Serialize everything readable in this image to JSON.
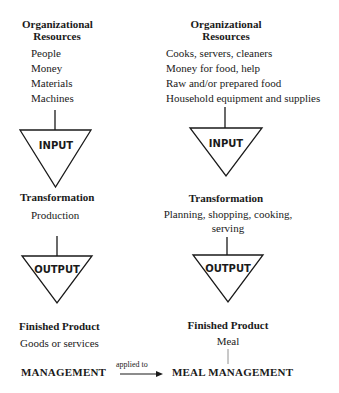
{
  "left_column": {
    "resources_heading": [
      "Organizational",
      "Resources"
    ],
    "resources": [
      "People",
      "Money",
      "Materials",
      "Machines"
    ],
    "input_label": "INPUT",
    "transformation_heading": "Transformation",
    "transformation": [
      "Production"
    ],
    "output_label": "OUTPUT",
    "product_heading": "Finished Product",
    "product": "Goods or services",
    "concept": "MANAGEMENT"
  },
  "right_column": {
    "resources_heading": [
      "Organizational",
      "Resources"
    ],
    "resources": [
      "Cooks, servers, cleaners",
      "Money for food, help",
      "Raw and/or prepared food",
      "Household equipment and supplies"
    ],
    "input_label": "INPUT",
    "transformation_heading": "Transformation",
    "transformation": [
      "Planning, shopping, cooking,",
      "serving"
    ],
    "output_label": "OUTPUT",
    "product_heading": "Finished Product",
    "product": "Meal",
    "concept": "MEAL MANAGEMENT"
  },
  "connector": {
    "label": "applied to"
  }
}
